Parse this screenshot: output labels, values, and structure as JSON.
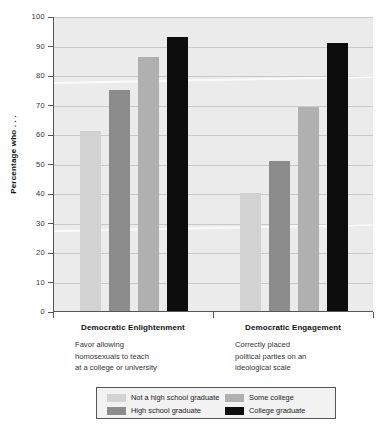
{
  "chart_data": {
    "type": "bar",
    "title": "",
    "xlabel": "",
    "ylabel": "Percentage who . . .",
    "ylim": [
      0,
      100
    ],
    "ytick_labels": [
      "100",
      "90",
      "80",
      "70",
      "60",
      "50",
      "40",
      "30",
      "20",
      "10",
      "0"
    ],
    "ytick_values": [
      100,
      90,
      80,
      70,
      60,
      50,
      40,
      30,
      20,
      10,
      0
    ],
    "grid": true,
    "legend_position": "bottom",
    "categories": [
      "Democratic Enlightenment",
      "Democratic Engagement"
    ],
    "category_descriptions": [
      "Favor allowing homosexuals to teach at a college or university",
      "Correctly placed political parties on an ideological scale"
    ],
    "series": [
      {
        "name": "Not a high school graduate",
        "color": "#d2d2d2",
        "values": [
          61,
          40
        ]
      },
      {
        "name": "High school graduate",
        "color": "#8c8c8c",
        "values": [
          75,
          51
        ]
      },
      {
        "name": "Some college",
        "color": "#b0b0b0",
        "values": [
          86,
          69
        ]
      },
      {
        "name": "College graduate",
        "color": "#0d0d0d",
        "values": [
          93,
          91
        ]
      }
    ]
  },
  "axis": {
    "y_title": "Percentage who . . .",
    "ticks": [
      {
        "label": "100",
        "value": 100
      },
      {
        "label": "90",
        "value": 90
      },
      {
        "label": "80",
        "value": 80
      },
      {
        "label": "70",
        "value": 70
      },
      {
        "label": "60",
        "value": 60
      },
      {
        "label": "50",
        "value": 50
      },
      {
        "label": "40",
        "value": 40
      },
      {
        "label": "30",
        "value": 30
      },
      {
        "label": "20",
        "value": 20
      },
      {
        "label": "10",
        "value": 10
      },
      {
        "label": "0",
        "value": 0
      }
    ]
  },
  "groups": [
    {
      "title": "Democratic Enlightenment",
      "desc_lines": [
        "Favor allowing",
        "homosexuals to teach",
        "at a college or university"
      ]
    },
    {
      "title": "Democratic Engagement",
      "desc_lines": [
        "Correctly placed",
        "political parties on an",
        "ideological scale"
      ]
    }
  ],
  "legend": {
    "items": [
      {
        "label": "Not a high school graduate",
        "color": "#d2d2d2"
      },
      {
        "label": "High school graduate",
        "color": "#8c8c8c"
      },
      {
        "label": "Some college",
        "color": "#b0b0b0"
      },
      {
        "label": "College graduate",
        "color": "#0d0d0d"
      }
    ]
  }
}
